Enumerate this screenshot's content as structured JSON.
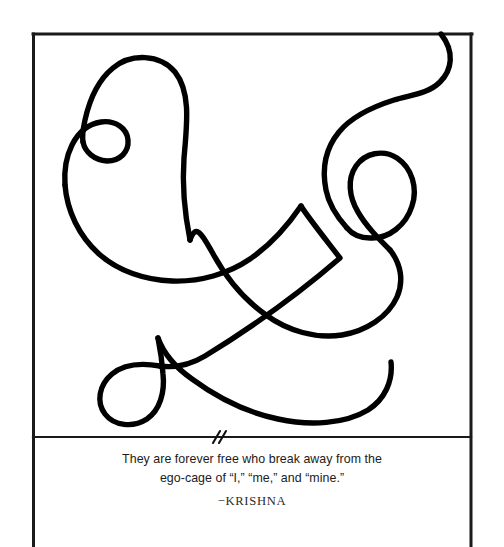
{
  "page": {
    "background_color": "#ffffff",
    "width": 504,
    "height": 547
  },
  "artwork": {
    "title": "continuous-line-drawing",
    "description": "Single continuous hand-drawn black line forming loops and arcs inside a rectangular frame",
    "stroke_color": "#000000",
    "stroke_width": 5.4,
    "frame": {
      "color": "#1a1a1a",
      "width": 3,
      "left": 33,
      "top": 34,
      "right": 472,
      "divider_y": 437,
      "bottom": 547
    },
    "tick_mark": {
      "name": "double-slash-tick",
      "x": 218,
      "y": 437
    }
  },
  "caption": {
    "quote_line_1": "They are forever free who break away from the",
    "quote_line_2": "ego-cage of “I,” “me,” and “mine.”",
    "attribution": "−KRISHNA",
    "text_color": "#1b1b1b"
  }
}
